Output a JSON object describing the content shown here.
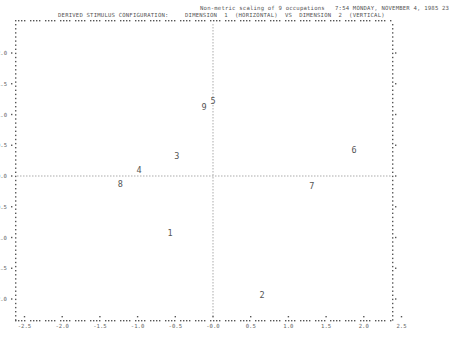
{
  "header": {
    "title": "Non-metric scaling of 9 occupations",
    "timestamp": "7:54 MONDAY, NOVEMBER 4, 1985",
    "page_number": "23",
    "subtitle_left": "DERIVED STIMULUS CONFIGURATION:",
    "subtitle_right": "DIMENSION  1  (HORIZONTAL)  VS  DIMENSION  2  (VERTICAL)"
  },
  "chart_data": {
    "type": "scatter",
    "title": "Non-metric scaling of 9 occupations",
    "subtitle": "DERIVED STIMULUS CONFIGURATION: DIMENSION 1 (HORIZONTAL) VS DIMENSION 2 (VERTICAL)",
    "xlabel": "Dimension 1",
    "ylabel": "Dimension 2",
    "xlim": [
      -2.5,
      2.5
    ],
    "ylim": [
      -2.35,
      2.35
    ],
    "x_ticks": [
      "-2.5",
      "-2.0",
      "-1.5",
      "-1.0",
      "-0.5",
      "-0.0",
      "0.5",
      "1.0",
      "1.5",
      "2.0",
      "2.5"
    ],
    "y_ticks": [
      "2.0",
      "1.5",
      "1.0",
      "0.5",
      "-0.0",
      "-0.5",
      "-1.0",
      "-1.5",
      "-2.0"
    ],
    "reference_lines": {
      "x": 0,
      "y": 0,
      "style": "dashed"
    },
    "grid": false,
    "legend": null,
    "points": [
      {
        "label": "1",
        "x": -0.57,
        "y": -0.93
      },
      {
        "label": "2",
        "x": 0.65,
        "y": -1.94
      },
      {
        "label": "3",
        "x": -0.48,
        "y": 0.33
      },
      {
        "label": "4",
        "x": -0.98,
        "y": 0.1
      },
      {
        "label": "5",
        "x": 0.0,
        "y": 1.22
      },
      {
        "label": "6",
        "x": 1.87,
        "y": 0.42
      },
      {
        "label": "7",
        "x": 1.31,
        "y": -0.16
      },
      {
        "label": "8",
        "x": -1.23,
        "y": -0.13
      },
      {
        "label": "9",
        "x": -0.12,
        "y": 1.12
      }
    ]
  }
}
